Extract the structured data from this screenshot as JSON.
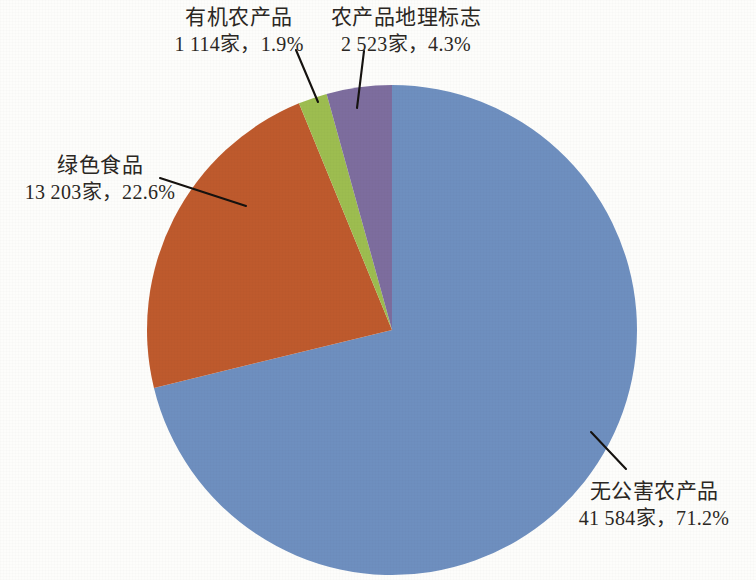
{
  "chart_data": {
    "type": "pie",
    "title": "",
    "subtitle": "",
    "xlabel": "",
    "ylabel": "",
    "legend_position": "none",
    "grid": false,
    "total_count": 58424,
    "unit_suffix": "家",
    "categories": [
      "无公害农产品",
      "绿色食品",
      "农产品地理标志",
      "有机农产品"
    ],
    "values": [
      71.2,
      22.6,
      4.3,
      1.9
    ],
    "counts": [
      41584,
      13203,
      2523,
      1114
    ],
    "colors": [
      "#6E8FBF",
      "#BE5A2D",
      "#7D6D9E",
      "#9DBD50"
    ],
    "slices": [
      {
        "name": "无公害农产品",
        "count_text": "41 584家",
        "percent_text": "71.2%",
        "value_line": "41 584家，71.2%",
        "value": 71.2,
        "count": 41584,
        "color": "#6E8FBF",
        "start_angle_deg": 0,
        "sweep_deg": 256.32
      },
      {
        "name": "绿色食品",
        "count_text": "13 203家",
        "percent_text": "22.6%",
        "value_line": "13 203家，22.6%",
        "value": 22.6,
        "count": 13203,
        "color": "#BE5A2D",
        "start_angle_deg": 256.32,
        "sweep_deg": 81.36
      },
      {
        "name": "有机农产品",
        "count_text": "1 114家",
        "percent_text": "1.9%",
        "value_line": "1 114家，1.9%",
        "value": 1.9,
        "count": 1114,
        "color": "#9DBD50",
        "start_angle_deg": 337.68,
        "sweep_deg": 6.84
      },
      {
        "name": "农产品地理标志",
        "count_text": "2 523家",
        "percent_text": "4.3%",
        "value_line": "2 523家，4.3%",
        "value": 4.3,
        "count": 2523,
        "color": "#7D6D9E",
        "start_angle_deg": 344.52,
        "sweep_deg": 15.48
      }
    ]
  },
  "labels": {
    "organic": {
      "name": "有机农产品",
      "value_line": "1 114家，1.9%"
    },
    "geo_indication": {
      "name": "农产品地理标志",
      "value_line": "2 523家，4.3%"
    },
    "green_food": {
      "name": "绿色食品",
      "value_line": "13 203家，22.6%"
    },
    "pollution_free": {
      "name": "无公害农产品",
      "value_line": "41 584家，71.2%"
    }
  },
  "geometry": {
    "center_x": 392,
    "center_y": 330,
    "radius": 245
  }
}
